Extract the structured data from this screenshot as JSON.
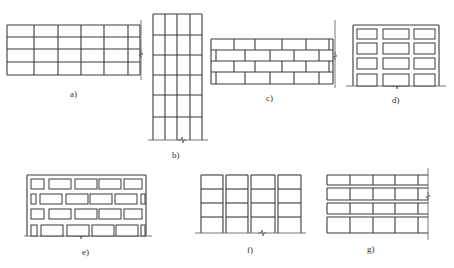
{
  "figure": {
    "line_color": "#3a3a3a",
    "background": "#ffffff",
    "panels": [
      {
        "id": "a",
        "label": "a)",
        "type": "rectangular grid wall with right break line",
        "columns": 6,
        "rows": 4
      },
      {
        "id": "b",
        "label": "b)",
        "type": "tall frame grid with ground break",
        "columns": 4,
        "rows": 6
      },
      {
        "id": "c",
        "label": "c)",
        "type": "staggered brick course wall with right break line",
        "rows": 4
      },
      {
        "id": "d",
        "label": "d)",
        "type": "frame with separated infill panels",
        "columns": 3,
        "rows": 4
      },
      {
        "id": "e",
        "label": "e)",
        "type": "frame with staggered separated infill blocks",
        "rows": 4
      },
      {
        "id": "f",
        "label": "f)",
        "type": "frame with double column lines (vertical joints)",
        "columns": 4,
        "rows": 4
      },
      {
        "id": "g",
        "label": "g)",
        "type": "wall with double horizontal joints and right break line",
        "columns": 5,
        "rows": 4
      }
    ]
  }
}
